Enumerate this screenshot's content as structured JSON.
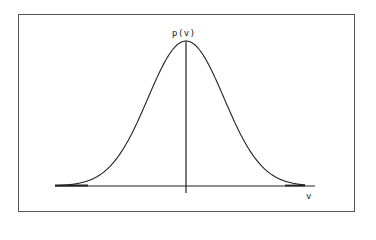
{
  "figure": {
    "y_axis_label": "p(v)",
    "x_axis_label": "v",
    "line_color": "#222222",
    "frame_color": "#555555"
  },
  "chart_data": {
    "type": "line",
    "title": "",
    "xlabel": "v",
    "ylabel": "p(v)",
    "distribution": "normal",
    "mean": 0,
    "x": [
      -3,
      -2.5,
      -2,
      -1.5,
      -1,
      -0.5,
      0,
      0.5,
      1,
      1.5,
      2,
      2.5,
      3
    ],
    "values": [
      0.011,
      0.044,
      0.135,
      0.325,
      0.607,
      0.882,
      1.0,
      0.882,
      0.607,
      0.325,
      0.135,
      0.044,
      0.011
    ],
    "grid": false,
    "ticks": false,
    "legend": null
  }
}
